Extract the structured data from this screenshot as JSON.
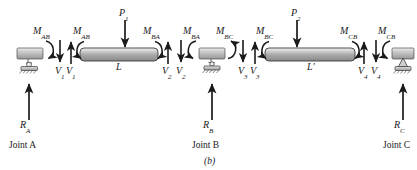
{
  "figure": {
    "caption": "(b)",
    "beam_segment_labels": [
      "L",
      "L′"
    ],
    "joints": [
      {
        "name": "joint-a",
        "label_prefix": "Joint",
        "label_letter": "A",
        "reaction": {
          "symbol": "R",
          "sub": "A"
        }
      },
      {
        "name": "joint-b",
        "label_prefix": "Joint",
        "label_letter": "B",
        "reaction": {
          "symbol": "R",
          "sub": "B"
        }
      },
      {
        "name": "joint-c",
        "label_prefix": "Joint",
        "label_letter": "C",
        "reaction": {
          "symbol": "R",
          "sub": "C"
        }
      }
    ],
    "point_loads": [
      {
        "symbol": "P",
        "sub": "1"
      },
      {
        "symbol": "P",
        "sub": "2"
      }
    ],
    "moments": [
      {
        "symbol": "M",
        "sub": "AB"
      },
      {
        "symbol": "M",
        "sub": "AB"
      },
      {
        "symbol": "M",
        "sub": "BA"
      },
      {
        "symbol": "M",
        "sub": "BA"
      },
      {
        "symbol": "M",
        "sub": "BC"
      },
      {
        "symbol": "M",
        "sub": "BC"
      },
      {
        "symbol": "M",
        "sub": "CB"
      },
      {
        "symbol": "M",
        "sub": "CB"
      }
    ],
    "shears": [
      {
        "symbol": "V",
        "sub": "1"
      },
      {
        "symbol": "V",
        "sub": "1"
      },
      {
        "symbol": "V",
        "sub": "2"
      },
      {
        "symbol": "V",
        "sub": "2"
      },
      {
        "symbol": "V",
        "sub": "3"
      },
      {
        "symbol": "V",
        "sub": "3"
      },
      {
        "symbol": "V",
        "sub": "4"
      },
      {
        "symbol": "V",
        "sub": "4"
      }
    ],
    "colors": {
      "ink": "#1a1a1a",
      "beam_fill_light": "#e8e8e8",
      "beam_fill_dark": "#8e8e8e",
      "support_fill": "#b8b8b8",
      "background": "#ffffff"
    }
  },
  "text": {
    "L": "L",
    "Lprime": "L′",
    "M": "M",
    "P": "P",
    "R": "R",
    "V": "V",
    "AB": "AB",
    "BA": "BA",
    "BC": "BC",
    "CB": "CB",
    "A": "A",
    "B": "B",
    "C": "C",
    "one": "1",
    "two": "2",
    "three": "3",
    "four": "4",
    "joint_a": "Joint A",
    "joint_b": "Joint B",
    "joint_c": "Joint C",
    "caption": "(b)"
  }
}
